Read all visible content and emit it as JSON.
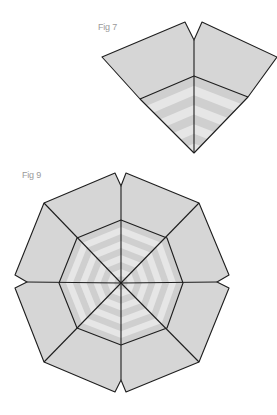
{
  "figures": [
    {
      "id": "fig7",
      "label": "Fig 7",
      "label_pos": [
        98,
        23
      ]
    },
    {
      "id": "fig9",
      "label": "Fig 9",
      "label_pos": [
        22,
        171
      ]
    }
  ],
  "colors": {
    "fill": "#d6d6d6",
    "stripe_light": "#e6e6e6",
    "stripe_dark": "#cfcfcf",
    "outline": "#1e1e1e",
    "label": "#9a9a9a"
  },
  "fig7": {
    "left_outer": [
      102,
      57
    ],
    "left_peak": [
      185,
      22
    ],
    "notch": [
      194,
      40
    ],
    "right_peak": [
      202,
      22
    ],
    "right_outer": [
      277,
      57
    ],
    "right_inner": [
      248,
      97
    ],
    "center": [
      194,
      76
    ],
    "left_inner": [
      140,
      99
    ],
    "tip": [
      194,
      153
    ]
  },
  "fig9": {
    "center": [
      121,
      283
    ],
    "outer": [
      [
        115,
        173
      ],
      [
        121,
        186
      ],
      [
        126,
        173
      ],
      [
        199,
        203
      ],
      [
        229,
        275
      ],
      [
        217,
        282
      ],
      [
        229,
        288
      ],
      [
        199,
        362
      ],
      [
        126,
        392
      ],
      [
        121,
        380
      ],
      [
        115,
        392
      ],
      [
        44,
        362
      ],
      [
        15,
        288
      ],
      [
        27,
        282
      ],
      [
        15,
        275
      ],
      [
        44,
        203
      ]
    ],
    "inner": [
      [
        121,
        220
      ],
      [
        167,
        238
      ],
      [
        183,
        283
      ],
      [
        167,
        328
      ],
      [
        121,
        345
      ],
      [
        77,
        328
      ],
      [
        59,
        283
      ],
      [
        77,
        238
      ]
    ],
    "spokes_outer": [
      [
        121,
        186
      ],
      [
        199,
        203
      ],
      [
        217,
        282
      ],
      [
        199,
        362
      ],
      [
        121,
        380
      ],
      [
        44,
        362
      ],
      [
        27,
        282
      ],
      [
        44,
        203
      ]
    ]
  }
}
